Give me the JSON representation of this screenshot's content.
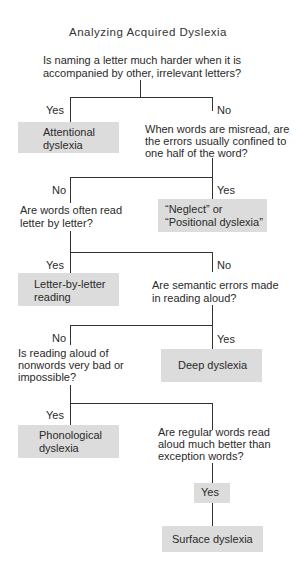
{
  "title": "Analyzing Acquired Dyslexia",
  "questions": {
    "q1": {
      "line1": "Is naming a letter much harder when it is",
      "line2": "accompanied by other, irrelevant letters?"
    },
    "q2": {
      "line1": "When words are misread, are",
      "line2": "the errors usually confined to",
      "line3": "one half of the word?"
    },
    "q3": {
      "line1": "Are words often read",
      "line2": "letter by letter?"
    },
    "q4": {
      "line1": "Are semantic errors made",
      "line2": "in reading aloud?"
    },
    "q5": {
      "line1": "Is reading aloud of",
      "line2": "nonwords very bad or",
      "line3": "impossible?"
    },
    "q6": {
      "line1": "Are regular words read",
      "line2": "aloud much better than",
      "line3": "exception words?"
    }
  },
  "labels": {
    "yes": "Yes",
    "no": "No"
  },
  "outcomes": {
    "attentional": {
      "line1": "Attentional",
      "line2": "dyslexia"
    },
    "neglect": {
      "line1": "“Neglect” or",
      "line2": "“Positional dyslexia”"
    },
    "letter_by_letter": {
      "line1": "Letter-by-letter",
      "line2": "reading"
    },
    "deep": {
      "line1": "Deep dyslexia"
    },
    "phonological": {
      "line1": "Phonological",
      "line2": "dyslexia"
    },
    "surface": {
      "line1": "Surface dyslexia"
    }
  },
  "colors": {
    "box_fill": "#dcdcdc",
    "line": "#333333",
    "text": "#2a2a2a"
  }
}
